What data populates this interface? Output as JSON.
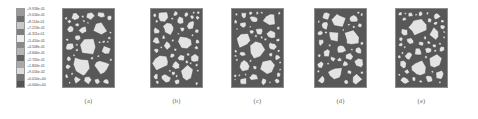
{
  "figure": {
    "type": "mesostructure-contour-figure",
    "background_color": "#ffffff"
  },
  "legend": {
    "name": "contour-legend",
    "style": "abaqus-contour-bands",
    "label_count": 13,
    "labels": [
      "+9.918e-01",
      "+9.016e-01",
      "+8.114e-01",
      "+7.213e-01",
      "+6.311e-01",
      "+5.410e-01",
      "+4.508e-01",
      "+3.606e-01",
      "+2.705e-01",
      "+1.803e-01",
      "+9.016e-02",
      "+0.010e+00",
      "+0.000e+00"
    ],
    "swatch_colors": [
      "#9a9a9a",
      "#6d6d6d",
      "#c9c9c9",
      "#7d7d7d",
      "#ededed",
      "#8a8a8a",
      "#b5b5b5",
      "#636363",
      "#a8a8a8",
      "#dcdcdc",
      "#747474",
      "#545454"
    ]
  },
  "panels": [
    {
      "id": "panel-a",
      "caption": "(a)",
      "x": 62,
      "matrix_color": "#585858",
      "aggregate_color": "#e3e3e3",
      "itz_color": "#3d3d3d"
    },
    {
      "id": "panel-b",
      "caption": "(b)",
      "x": 150,
      "matrix_color": "#585858",
      "aggregate_color": "#e3e3e3",
      "itz_color": "#3d3d3d"
    },
    {
      "id": "panel-c",
      "caption": "(c)",
      "x": 231,
      "matrix_color": "#585858",
      "aggregate_color": "#e3e3e3",
      "itz_color": "#3d3d3d"
    },
    {
      "id": "panel-d",
      "caption": "(d)",
      "x": 314,
      "matrix_color": "#585858",
      "aggregate_color": "#e3e3e3",
      "itz_color": "#3d3d3d"
    },
    {
      "id": "panel-e",
      "caption": "(e)",
      "x": 395,
      "matrix_color": "#585858",
      "aggregate_color": "#e3e3e3",
      "itz_color": "#3d3d3d"
    }
  ]
}
